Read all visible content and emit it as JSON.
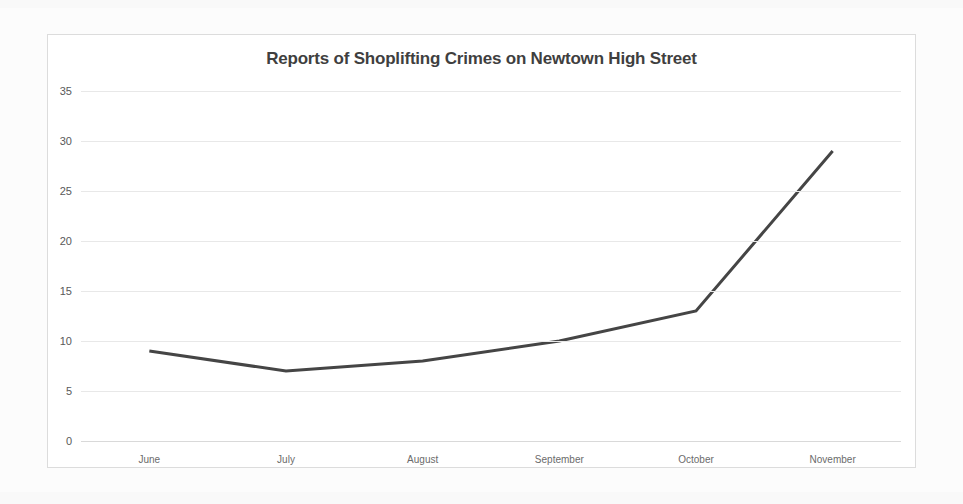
{
  "chart_data": {
    "type": "line",
    "title": "Reports of Shoplifting Crimes on Newtown High Street",
    "xlabel": "",
    "ylabel": "",
    "categories": [
      "June",
      "July",
      "August",
      "September",
      "October",
      "November"
    ],
    "values": [
      9,
      7,
      8,
      10,
      13,
      29
    ],
    "series": [
      {
        "name": "Reports of Shoplifting Crimes",
        "values": [
          9,
          7,
          8,
          10,
          13,
          29
        ]
      }
    ],
    "ylim": [
      0,
      35
    ],
    "yticks": [
      0,
      5,
      10,
      15,
      20,
      25,
      30,
      35
    ],
    "ytick_labels": [
      "0",
      "5",
      "10",
      "15",
      "20",
      "25",
      "30",
      "35"
    ],
    "grid": true,
    "legend": false,
    "legend_position": "none",
    "line_color": "#454545",
    "grid_color": "#e8e8e8",
    "title_color": "#3f3f3f",
    "axis_label_color": "#6b6b6b",
    "background_color": "#ffffff"
  }
}
